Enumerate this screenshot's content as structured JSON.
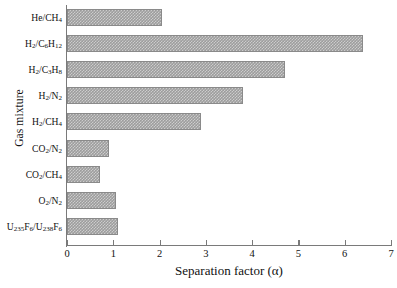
{
  "chart_data": {
    "type": "bar",
    "orientation": "horizontal",
    "title": "",
    "xlabel": "Separation factor (α)",
    "ylabel": "Gas mixture",
    "xlim": [
      0,
      7
    ],
    "grid": false,
    "legend": null,
    "xticks": [
      "0",
      "1",
      "2",
      "3",
      "4",
      "5",
      "6",
      "7"
    ],
    "categories": [
      "He/CH4",
      "H2/C6H12",
      "H2/C3H8",
      "H2/N2",
      "H2/CH4",
      "CO2/N2",
      "CO2/CH4",
      "O2/N2",
      "U235F6/U238F6"
    ],
    "category_labels_html": [
      "He/CH<sub>4</sub>",
      "H<sub>2</sub>/C<sub>6</sub>H<sub>12</sub>",
      "H<sub>2</sub>/C<sub>3</sub>H<sub>8</sub>",
      "H<sub>2</sub>/N<sub>2</sub>",
      "H<sub>2</sub>/CH<sub>4</sub>",
      "CO<sub>2</sub>/N<sub>2</sub>",
      "CO<sub>2</sub>/CH<sub>4</sub>",
      "O<sub>2</sub>/N<sub>2</sub>",
      "U<sub>235</sub>F<sub>6</sub>/U<sub>238</sub>F<sub>6</sub>"
    ],
    "values": [
      2.05,
      6.4,
      4.7,
      3.8,
      2.9,
      0.9,
      0.72,
      1.05,
      1.1
    ],
    "bar_color": "#9d9d9d",
    "bar_pattern": "checkerboard-hatch",
    "axis_color": "#7a7a7a"
  }
}
